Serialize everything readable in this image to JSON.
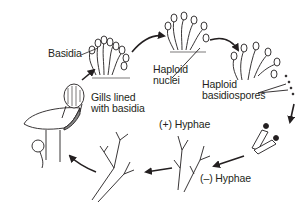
{
  "diagram": {
    "type": "life-cycle",
    "stroke_color": "#231f20",
    "background": "#ffffff",
    "labels": {
      "basidia": "Basidia",
      "haploid_nuclei_line1": "Haploid",
      "haploid_nuclei_line2": "nuclei",
      "haploid_basidiospores_line1": "Haploid",
      "haploid_basidiospores_line2": "basidiospores",
      "gills_line1": "Gills lined",
      "gills_line2": "with basidia",
      "plus_hyphae": "(+) Hyphae",
      "minus_hyphae": "(–) Hyphae"
    },
    "stages": [
      {
        "id": "basidia",
        "label": "Basidia"
      },
      {
        "id": "haploid-nuclei",
        "label": "Haploid nuclei"
      },
      {
        "id": "haploid-basidiospores",
        "label": "Haploid basidiospores"
      },
      {
        "id": "germinating-spores",
        "label": ""
      },
      {
        "id": "hyphae",
        "label": "(+) Hyphae / (–) Hyphae"
      },
      {
        "id": "dikaryotic-mycelium",
        "label": ""
      },
      {
        "id": "mushroom",
        "label": "Gills lined with basidia"
      }
    ]
  }
}
